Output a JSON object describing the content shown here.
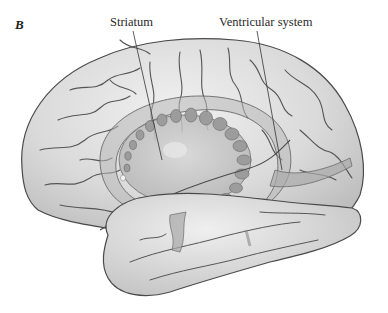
{
  "figure": {
    "panel_letter": "B",
    "labels": [
      {
        "id": "striatum",
        "text": "Striatum"
      },
      {
        "id": "ventricular",
        "text": "Ventricular system"
      }
    ]
  },
  "colors": {
    "background": "#ffffff",
    "brain_fill": "#dcdcdc",
    "brain_highlight": "#ececec",
    "brain_outline": "#4a4a4a",
    "sulci": "#555555",
    "striatum_fill": "#c4c4c4",
    "ventricle_fill": "#a9a9a9",
    "leader_line": "#333333"
  }
}
